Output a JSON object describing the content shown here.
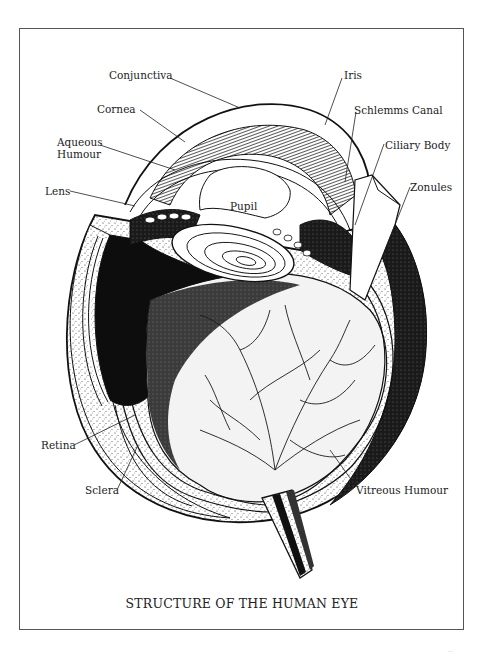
{
  "figure": {
    "caption": "STRUCTURE OF THE HUMAN EYE",
    "labels": {
      "conjunctiva": "Conjunctiva",
      "iris": "Iris",
      "cornea": "Cornea",
      "schlemms_canal": "Schlemms Canal",
      "aqueous_humour_line1": "Aqueous",
      "aqueous_humour_line2": "Humour",
      "ciliary_body": "Ciliary Body",
      "lens": "Lens",
      "zonules": "Zonules",
      "pupil": "Pupil",
      "retina": "Retina",
      "sclera": "Sclera",
      "vitreous_humour": "Vitreous Humour"
    },
    "page_number": ".."
  },
  "colors": {
    "ink": "#111111",
    "frame": "#555555",
    "paper": "#ffffff"
  }
}
